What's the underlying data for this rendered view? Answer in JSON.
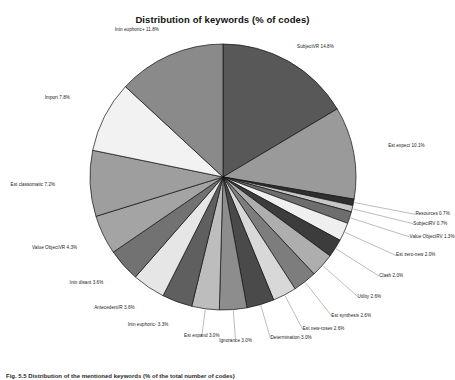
{
  "chart_data": {
    "type": "pie",
    "title": "Distribution of keywords (% of codes)",
    "xlabel": "",
    "ylabel": "",
    "legend_position": "none",
    "grid": false,
    "value_unit": "%",
    "total": 100.0,
    "start_angle_deg": -90,
    "direction": "clockwise",
    "categories": [
      "SubjectVR",
      "Est expect",
      "Resources",
      "SubjectRV",
      "Value ObjectRV",
      "Est zero-new",
      "Clash",
      "Utility",
      "Est synthesis",
      "Est new-roses",
      "Determination",
      "Ignorance",
      "Est expand",
      "Intn euphoric-",
      "Antecedent/R",
      "Intn disant",
      "Value ObjectVR",
      "Est classomatic",
      "Import",
      "Intn euphoric+"
    ],
    "values": [
      14.8,
      10.1,
      0.7,
      0.7,
      1.3,
      2.0,
      2.0,
      2.6,
      2.6,
      2.6,
      3.0,
      3.0,
      3.0,
      3.3,
      3.6,
      3.6,
      4.3,
      7.2,
      7.8,
      11.8
    ],
    "colors": [
      "#585858",
      "#9a9a9a",
      "#2f2f2f",
      "#c8c8c8",
      "#6e6e6e",
      "#efefef",
      "#3c3c3c",
      "#aeaeae",
      "#7d7d7d",
      "#d8d8d8",
      "#4a4a4a",
      "#8d8d8d",
      "#bdbdbd",
      "#5f5f5f",
      "#e6e6e6",
      "#727272",
      "#a4a4a4",
      "#9e9e9e",
      "#f2f2f2",
      "#8a8a8a"
    ],
    "slices": [
      {
        "label": "SubjectVR 14.8%",
        "name": "SubjectVR",
        "value": 14.8
      },
      {
        "label": "Est expect 10.1%",
        "name": "Est expect",
        "value": 10.1
      },
      {
        "label": "Resources 0.7%",
        "name": "Resources",
        "value": 0.7
      },
      {
        "label": "SubjectRV 0.7%",
        "name": "SubjectRV",
        "value": 0.7
      },
      {
        "label": "Value ObjectRV 1.3%",
        "name": "Value ObjectRV",
        "value": 1.3
      },
      {
        "label": "Est zero-new 2.0%",
        "name": "Est zero-new",
        "value": 2.0
      },
      {
        "label": "Clash 2.0%",
        "name": "Clash",
        "value": 2.0
      },
      {
        "label": "Utility 2.6%",
        "name": "Utility",
        "value": 2.6
      },
      {
        "label": "Est synthesis 2.6%",
        "name": "Est synthesis",
        "value": 2.6
      },
      {
        "label": "Est new-roses 2.6%",
        "name": "Est new-roses",
        "value": 2.6
      },
      {
        "label": "Determination 3.0%",
        "name": "Determination",
        "value": 3.0
      },
      {
        "label": "Ignorance 3.0%",
        "name": "Ignorance",
        "value": 3.0
      },
      {
        "label": "Est expand 3.0%",
        "name": "Est expand",
        "value": 3.0
      },
      {
        "label": "Intn euphoric- 3.3%",
        "name": "Intn euphoric-",
        "value": 3.3
      },
      {
        "label": "Antecedent/R 3.6%",
        "name": "Antecedent/R",
        "value": 3.6
      },
      {
        "label": "Intn disant 3.6%",
        "name": "Intn disant",
        "value": 3.6
      },
      {
        "label": "Value ObjectVR 4.3%",
        "name": "Value ObjectVR",
        "value": 4.3
      },
      {
        "label": "Est classomatic 7.2%",
        "name": "Est classomatic",
        "value": 7.2
      },
      {
        "label": "Import 7.8%",
        "name": "Import",
        "value": 7.8
      },
      {
        "label": "Intn euphoric+ 11.8%",
        "name": "Intn euphoric+",
        "value": 11.8
      }
    ]
  },
  "caption": {
    "text": "Fig. 5.5 Distribution of the mentioned keywords (% of the total number of codes)"
  }
}
